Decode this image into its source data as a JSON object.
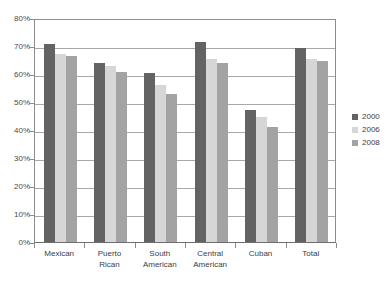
{
  "chart_data": {
    "type": "bar",
    "title": "",
    "subtitle": "",
    "xlabel": "",
    "ylabel": "",
    "ylim": [
      0,
      80
    ],
    "y_tick_labels": [
      "0%",
      "10%",
      "20%",
      "30%",
      "40%",
      "50%",
      "60%",
      "70%",
      "80%"
    ],
    "y_tick_values": [
      0,
      10,
      20,
      30,
      40,
      50,
      60,
      70,
      80
    ],
    "grid": true,
    "legend_position": "right",
    "categories": [
      "Mexican",
      "Puerto\nRican",
      "South\nAmerican",
      "Central\nAmerican",
      "Cuban",
      "Total"
    ],
    "series": [
      {
        "name": "2000",
        "color": "#636363",
        "values": [
          70.7,
          64.0,
          60.3,
          71.5,
          47.0,
          69.2
        ]
      },
      {
        "name": "2006",
        "color": "#d6d6d6",
        "values": [
          67.0,
          63.0,
          56.0,
          65.5,
          44.5,
          65.5
        ]
      },
      {
        "name": "2008",
        "color": "#a3a3a3",
        "values": [
          66.5,
          60.7,
          53.0,
          64.0,
          41.0,
          64.5
        ]
      }
    ]
  },
  "legend": {
    "items": [
      {
        "label": "2000",
        "swatch": "legend-swatch-2000"
      },
      {
        "label": "2006",
        "swatch": "legend-swatch-2006"
      },
      {
        "label": "2008",
        "swatch": "legend-swatch-2008"
      }
    ]
  },
  "colors": {
    "series_2000": "#636363",
    "series_2006": "#d6d6d6",
    "series_2008": "#a3a3a3",
    "gridline": "#a8a8a8",
    "axis": "#8c8c8c",
    "text": "#3d3d3d",
    "background": "#ffffff"
  }
}
